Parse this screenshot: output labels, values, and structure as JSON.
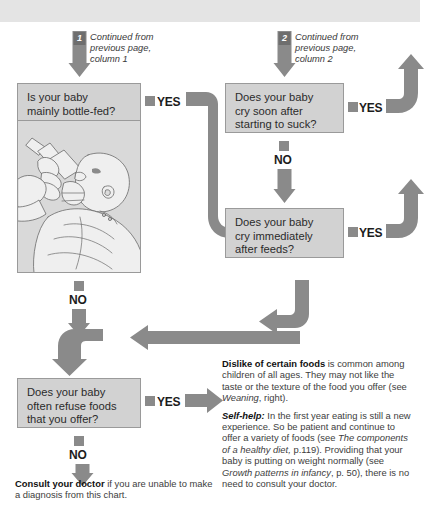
{
  "meta": {
    "colors": {
      "arrow_gray": "#8a8a8a",
      "box_fill": "#d2d2d2",
      "box_border": "#9a9a9a",
      "top_band": "#e4e4e4",
      "text_dark": "#2b2b2b"
    }
  },
  "entry_points": [
    {
      "number": "1",
      "caption_lines": [
        "Continued from",
        "previous page,",
        "column 1"
      ]
    },
    {
      "number": "2",
      "caption_lines": [
        "Continued from",
        "previous page,",
        "column 2"
      ]
    }
  ],
  "boxes": [
    {
      "id": "bottle-fed",
      "lines": [
        "Is your baby",
        "mainly bottle-fed?"
      ]
    },
    {
      "id": "cry-soon-after-suck",
      "lines": [
        "Does your baby",
        "cry soon after",
        "starting to suck?"
      ]
    },
    {
      "id": "cry-immediately-after-feeds",
      "lines": [
        "Does your baby",
        "cry immediately",
        "after feeds?"
      ]
    },
    {
      "id": "refuse-foods",
      "lines": [
        "Does your baby",
        "often refuse foods",
        "that you offer?"
      ]
    }
  ],
  "labels": {
    "yes": "YES",
    "no": "NO"
  },
  "illustration": {
    "alt": "line drawing of an adult bottle-feeding a baby"
  },
  "advice": {
    "paragraph_1": {
      "heading": "Dislike of certain foods",
      "body_before_ref": " is common among children of all ages. They may not like the taste or the texture of the food you offer (see ",
      "reference": "Weaning",
      "body_after_ref": ", right)."
    },
    "paragraph_2": {
      "heading": "Self-help:",
      "part_1": " In the first year eating is still a new experience. So be patient and continue to offer a variety of foods (see ",
      "reference_1": "The components of a healthy diet,",
      "part_2": " p.119). Providing that your baby is putting on weight normally (see ",
      "reference_2": "Growth patterns in infancy",
      "part_3": ", p. 50), there is no need to consult your doctor."
    }
  },
  "footnote": {
    "heading": "Consult your doctor",
    "body": " if you are unable to make a diagnosis from this chart."
  }
}
